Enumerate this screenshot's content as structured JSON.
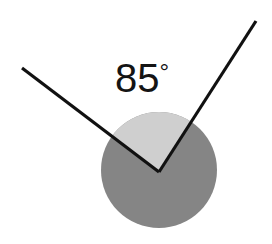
{
  "figure": {
    "background_color": "#ffffff"
  },
  "label": {
    "value": "85",
    "degree_symbol": "°",
    "full_text": "85°",
    "color": "#141414",
    "position": {
      "x": 142,
      "y": 92
    }
  },
  "chart_data": {
    "type": "diagram",
    "shapes": [
      {
        "name": "shaded-circle",
        "kind": "circle",
        "center": [
          159,
          170
        ],
        "radius": 58,
        "fill": "#858585"
      },
      {
        "name": "angle-wedge",
        "kind": "sector",
        "center": [
          159,
          172
        ],
        "radius": 58,
        "start_angle_deg": 57.3,
        "end_angle_deg": 142.8,
        "sweep_deg": 85,
        "fill": "#cfcfcf"
      },
      {
        "name": "ray-left",
        "kind": "segment",
        "from": [
          159,
          172
        ],
        "to": [
          22,
          68
        ],
        "stroke": "#111111",
        "stroke_width": 3.2,
        "angle_deg": 142.8
      },
      {
        "name": "ray-right",
        "kind": "segment",
        "from": [
          159,
          172
        ],
        "to": [
          256,
          21
        ],
        "stroke": "#111111",
        "stroke_width": 3.2,
        "angle_deg": 57.3
      }
    ],
    "vertex": [
      159,
      172
    ],
    "angle_value": 85,
    "angle_unit": "degrees",
    "annotations": [
      "85°"
    ]
  },
  "colors": {
    "circle_gray": "#858585",
    "wedge_gray": "#cfcfcf",
    "line_black": "#111111",
    "text_black": "#141414",
    "background": "#ffffff"
  }
}
